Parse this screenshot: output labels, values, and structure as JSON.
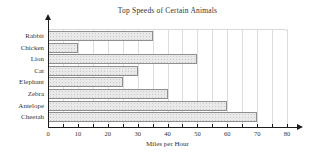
{
  "chart_data": {
    "type": "bar",
    "orientation": "horizontal",
    "title": "Top Speeds of Certain Animals",
    "xlabel": "Miles per Hour",
    "ylabel": "",
    "categories": [
      "Rabbit",
      "Chicken",
      "Lion",
      "Cat",
      "Elephant",
      "Zebra",
      "Antelope",
      "Cheetah"
    ],
    "values": [
      35,
      10,
      50,
      30,
      25,
      40,
      60,
      70
    ],
    "xlim": [
      0,
      80
    ],
    "xticks": [
      0,
      10,
      20,
      30,
      40,
      50,
      60,
      70,
      80
    ],
    "minor_grid_step": 5,
    "grid": "vertical minor gridlines every 5",
    "legend": "none",
    "colors": {
      "bar_fill": "#e9e9e9",
      "bar_dot_texture": "#c8c8c8",
      "bar_border": "#8f8f8f",
      "gridline": "#dcdcdc",
      "axis": "#1c1c1c",
      "text": "#333333",
      "background": "#ffffff"
    }
  }
}
